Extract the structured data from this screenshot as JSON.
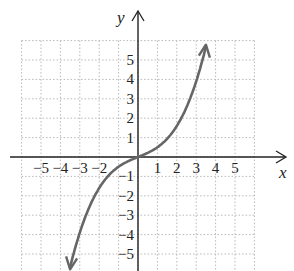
{
  "chart_data": {
    "type": "line",
    "title": "",
    "xlabel": "x",
    "ylabel": "y",
    "xlim": [
      -6,
      6
    ],
    "ylim": [
      -6,
      6
    ],
    "grid": true,
    "grid_style": "dotted",
    "x_ticks": [
      -5,
      -4,
      -3,
      -2,
      1,
      2,
      3,
      4,
      5
    ],
    "y_ticks": [
      5,
      4,
      3,
      2,
      1,
      -1,
      -2,
      -3,
      -4,
      -5
    ],
    "x_tick_labels": [
      "−5",
      "−4",
      "−3",
      "−2",
      "1",
      "2",
      "3",
      "4",
      "5"
    ],
    "y_tick_labels": [
      "5",
      "4",
      "3",
      "2",
      "1",
      "−1",
      "−2",
      "−3",
      "−4",
      "−5"
    ],
    "series": [
      {
        "name": "f(x)",
        "color": "#666666",
        "arrows_at_ends": true,
        "x": [
          -3.5,
          -3,
          -2.5,
          -2,
          -1.5,
          -1,
          -0.5,
          0,
          0.5,
          1,
          1.5,
          2,
          2.5,
          3,
          3.5
        ],
        "y": [
          -5.7,
          -3.9,
          -2.6,
          -1.6,
          -0.9,
          -0.5,
          -0.2,
          0,
          0.2,
          0.5,
          0.9,
          1.6,
          2.6,
          3.9,
          5.7
        ]
      }
    ]
  },
  "labels": {
    "x_axis": "x",
    "y_axis": "y"
  }
}
